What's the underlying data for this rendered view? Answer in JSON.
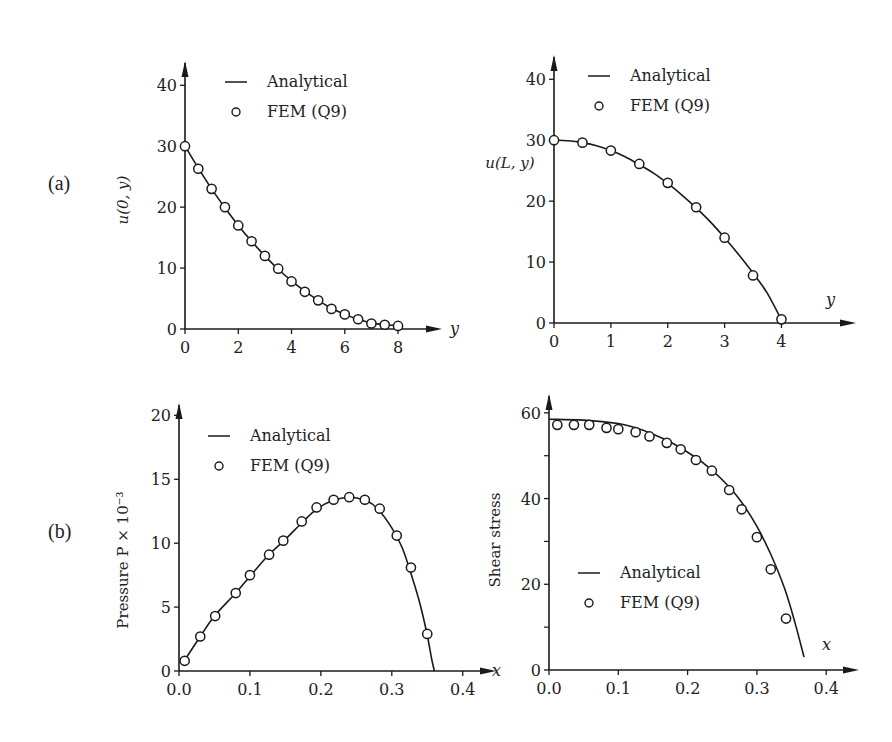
{
  "figure": {
    "row_labels": [
      {
        "label": "(a)",
        "x": 48,
        "y": 172
      },
      {
        "label": "(b)",
        "x": 48,
        "y": 520
      }
    ]
  },
  "chart_data": [
    {
      "id": "u0y",
      "type": "line",
      "title": "",
      "ylabel": "u(0, y)",
      "xlabel": "y",
      "xlim": [
        0,
        9.2
      ],
      "ylim": [
        0,
        43
      ],
      "xticks": [
        0,
        2,
        4,
        6,
        8
      ],
      "xtick_labels": [
        "0",
        "2",
        "4",
        "6",
        "8"
      ],
      "yticks": [
        0,
        10,
        20,
        30,
        40
      ],
      "ytick_labels": [
        "0",
        "10",
        "20",
        "30",
        "40"
      ],
      "minor_yticks": [],
      "grid": false,
      "legend": {
        "position": "upper-right",
        "entries": [
          "Analytical",
          "FEM (Q9)"
        ]
      },
      "series": [
        {
          "name": "Analytical",
          "style": "line",
          "x": [
            0,
            0.5,
            1,
            1.5,
            2,
            2.5,
            3,
            3.5,
            4,
            4.5,
            5,
            5.5,
            6,
            6.5,
            7,
            7.5,
            8
          ],
          "y": [
            30,
            26.4,
            23.0,
            19.9,
            17.0,
            14.4,
            12.0,
            9.8,
            7.9,
            6.2,
            4.7,
            3.4,
            2.4,
            1.6,
            1.0,
            0.7,
            0.6
          ]
        },
        {
          "name": "FEM (Q9)",
          "style": "marker-circle",
          "x": [
            0,
            0.5,
            1,
            1.5,
            2,
            2.5,
            3,
            3.5,
            4,
            4.5,
            5,
            5.5,
            6,
            6.5,
            7,
            7.5,
            8
          ],
          "y": [
            30,
            26.3,
            23.0,
            20.0,
            17.0,
            14.4,
            12.0,
            9.9,
            7.8,
            6.1,
            4.7,
            3.3,
            2.4,
            1.6,
            0.9,
            0.7,
            0.5
          ]
        }
      ]
    },
    {
      "id": "uLy",
      "type": "line",
      "title": "",
      "ylabel": "u(L, y)",
      "xlabel": "y",
      "xlim": [
        0,
        5.1
      ],
      "ylim": [
        0,
        43
      ],
      "xticks": [
        0,
        1,
        2,
        3,
        4
      ],
      "xtick_labels": [
        "0",
        "1",
        "2",
        "3",
        "4"
      ],
      "yticks": [
        0,
        10,
        20,
        30,
        40
      ],
      "ytick_labels": [
        "0",
        "10",
        "20",
        "30",
        "40"
      ],
      "minor_yticks": [],
      "grid": false,
      "legend": {
        "position": "upper-right",
        "entries": [
          "Analytical",
          "FEM (Q9)"
        ]
      },
      "series": [
        {
          "name": "Analytical",
          "style": "line",
          "x": [
            0,
            0.25,
            0.5,
            0.75,
            1,
            1.25,
            1.5,
            1.75,
            2,
            2.25,
            2.5,
            2.75,
            3,
            3.25,
            3.5,
            3.75,
            4
          ],
          "y": [
            30,
            29.9,
            29.6,
            29.1,
            28.3,
            27.3,
            26.0,
            24.6,
            22.9,
            21.0,
            18.9,
            16.6,
            14.0,
            11.2,
            8.2,
            4.9,
            0.5
          ]
        },
        {
          "name": "FEM (Q9)",
          "style": "marker-circle",
          "x": [
            0,
            0.5,
            1,
            1.5,
            2,
            2.5,
            3,
            3.5,
            4
          ],
          "y": [
            30,
            29.6,
            28.3,
            26.1,
            23.0,
            19.0,
            14.0,
            7.8,
            0.6
          ]
        }
      ]
    },
    {
      "id": "pressure",
      "type": "line",
      "title": "",
      "ylabel": "Pressure P × 10⁻³",
      "xlabel": "x",
      "xlim": [
        0,
        0.43
      ],
      "ylim": [
        0,
        20.5
      ],
      "xticks": [
        0,
        0.1,
        0.2,
        0.3,
        0.4
      ],
      "xtick_labels": [
        "0.0",
        "0.1",
        "0.2",
        "0.3",
        "0.4"
      ],
      "yticks": [
        0,
        5,
        10,
        15,
        20
      ],
      "ytick_labels": [
        "0",
        "5",
        "10",
        "15",
        "20"
      ],
      "minor_yticks": [],
      "grid": false,
      "legend": {
        "position": "upper-left",
        "entries": [
          "Analytical",
          "FEM (Q9)"
        ]
      },
      "series": [
        {
          "name": "Analytical",
          "style": "line",
          "x": [
            0.005,
            0.03,
            0.05,
            0.08,
            0.1,
            0.125,
            0.15,
            0.175,
            0.195,
            0.215,
            0.24,
            0.265,
            0.28,
            0.3,
            0.315,
            0.33,
            0.34,
            0.35,
            0.356,
            0.36
          ],
          "y": [
            0.6,
            2.7,
            4.3,
            6.1,
            7.4,
            9.0,
            10.3,
            11.7,
            12.7,
            13.3,
            13.6,
            13.3,
            12.7,
            11.2,
            9.6,
            7.1,
            5.2,
            2.8,
            1.0,
            0.0
          ]
        },
        {
          "name": "FEM (Q9)",
          "style": "marker-circle",
          "x": [
            0.008,
            0.03,
            0.051,
            0.08,
            0.1,
            0.127,
            0.147,
            0.173,
            0.194,
            0.218,
            0.24,
            0.262,
            0.283,
            0.307,
            0.327,
            0.35
          ],
          "y": [
            0.8,
            2.7,
            4.3,
            6.1,
            7.5,
            9.1,
            10.2,
            11.7,
            12.8,
            13.4,
            13.6,
            13.4,
            12.7,
            10.6,
            8.1,
            2.9
          ]
        }
      ]
    },
    {
      "id": "shear",
      "type": "line",
      "title": "",
      "ylabel": "Shear stress",
      "xlabel": "x",
      "xlim": [
        0,
        0.43
      ],
      "ylim": [
        0,
        63
      ],
      "xticks": [
        0,
        0.1,
        0.2,
        0.3,
        0.4
      ],
      "xtick_labels": [
        "0.0",
        "0.1",
        "0.2",
        "0.3",
        "0.4"
      ],
      "yticks": [
        0,
        20,
        40,
        60
      ],
      "ytick_labels": [
        "0",
        "20",
        "40",
        "60"
      ],
      "minor_yticks": [
        10,
        30,
        50
      ],
      "grid": false,
      "legend": {
        "position": "lower-left",
        "entries": [
          "Analytical",
          "FEM (Q9)"
        ]
      },
      "series": [
        {
          "name": "Analytical",
          "style": "line",
          "x": [
            0,
            0.05,
            0.1,
            0.125,
            0.15,
            0.175,
            0.2,
            0.225,
            0.25,
            0.275,
            0.3,
            0.32,
            0.34,
            0.355,
            0.368
          ],
          "y": [
            58.5,
            58.3,
            57.5,
            56.5,
            55.0,
            53.2,
            50.8,
            48.0,
            44.4,
            39.8,
            33.5,
            27.0,
            19.0,
            11.0,
            3.0
          ]
        },
        {
          "name": "FEM (Q9)",
          "style": "marker-circle",
          "x": [
            0.012,
            0.036,
            0.058,
            0.083,
            0.1,
            0.125,
            0.145,
            0.17,
            0.19,
            0.212,
            0.235,
            0.26,
            0.278,
            0.3,
            0.32,
            0.342
          ],
          "y": [
            57.2,
            57.2,
            57.2,
            56.5,
            56.2,
            55.5,
            54.5,
            53.0,
            51.5,
            49.0,
            46.5,
            42.0,
            37.5,
            31.0,
            23.5,
            12.0
          ]
        }
      ]
    }
  ]
}
